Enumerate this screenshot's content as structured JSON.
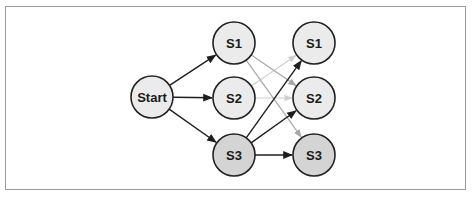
{
  "diagram": {
    "type": "state-transition-graph",
    "colors": {
      "node_fill": "#ebebeb",
      "node_fill_highlight": "#d4d4d4",
      "node_stroke": "#222222",
      "edge_dark": "#1e1e1e",
      "edge_gray": "#a8a8a8",
      "edge_light": "#d0d0d0",
      "frame": "#9a9a9a"
    },
    "nodes": [
      {
        "id": "start",
        "label": "Start",
        "x": 152,
        "y": 97,
        "highlight": false
      },
      {
        "id": "l_s1",
        "label": "S1",
        "x": 234,
        "y": 43,
        "highlight": false
      },
      {
        "id": "l_s2",
        "label": "S2",
        "x": 234,
        "y": 98,
        "highlight": false
      },
      {
        "id": "l_s3",
        "label": "S3",
        "x": 234,
        "y": 155,
        "highlight": true
      },
      {
        "id": "r_s1",
        "label": "S1",
        "x": 314,
        "y": 43,
        "highlight": false
      },
      {
        "id": "r_s2",
        "label": "S2",
        "x": 314,
        "y": 98,
        "highlight": false
      },
      {
        "id": "r_s3",
        "label": "S3",
        "x": 314,
        "y": 155,
        "highlight": true
      }
    ],
    "edges": [
      {
        "from": "start",
        "to": "l_s1",
        "style": "dark"
      },
      {
        "from": "start",
        "to": "l_s2",
        "style": "dark"
      },
      {
        "from": "start",
        "to": "l_s3",
        "style": "dark"
      },
      {
        "from": "l_s1",
        "to": "r_s2",
        "style": "gray"
      },
      {
        "from": "l_s1",
        "to": "r_s3",
        "style": "gray"
      },
      {
        "from": "l_s2",
        "to": "r_s1",
        "style": "light"
      },
      {
        "from": "l_s2",
        "to": "r_s2",
        "style": "light"
      },
      {
        "from": "l_s3",
        "to": "r_s1",
        "style": "dark"
      },
      {
        "from": "l_s3",
        "to": "r_s2",
        "style": "dark"
      },
      {
        "from": "l_s3",
        "to": "r_s3",
        "style": "dark"
      }
    ]
  }
}
